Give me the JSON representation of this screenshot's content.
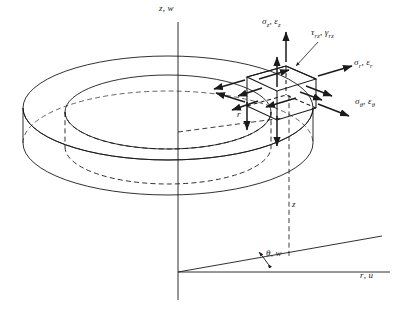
{
  "figure": {
    "type": "engineering-diagram",
    "stroke_color": "#1a1a1a",
    "background_color": "#ffffff"
  },
  "axes": {
    "vertical": {
      "label": "z, w",
      "symbol_1": "z",
      "symbol_2": "w"
    },
    "horizontal": {
      "label": "r, u",
      "symbol_1": "r",
      "symbol_2": "u"
    },
    "angle": {
      "label": "θ, w",
      "symbol_1": "θ",
      "symbol_2": "w"
    }
  },
  "dimensions": {
    "radius": {
      "label": "r"
    },
    "height": {
      "label": "z"
    }
  },
  "stress_components": [
    {
      "id": "axial",
      "name": "sigma-z-epsilon-z",
      "stress": "σ",
      "stress_sub": "z",
      "strain": "ε",
      "strain_sub": "z",
      "label": "σz, εz"
    },
    {
      "id": "shear",
      "name": "tau-rz-gamma-rz",
      "stress": "τ",
      "stress_sub": "rz",
      "strain": "γ",
      "strain_sub": "rz",
      "label": "τrz, γrz"
    },
    {
      "id": "radial",
      "name": "sigma-r-epsilon-r",
      "stress": "σ",
      "stress_sub": "r",
      "strain": "ε",
      "strain_sub": "r",
      "label": "σr, εr"
    },
    {
      "id": "hoop",
      "name": "sigma-theta-epsilon-theta",
      "stress": "σ",
      "stress_sub": "θ",
      "strain": "ε",
      "strain_sub": "θ",
      "label": "σθ, εθ"
    }
  ]
}
